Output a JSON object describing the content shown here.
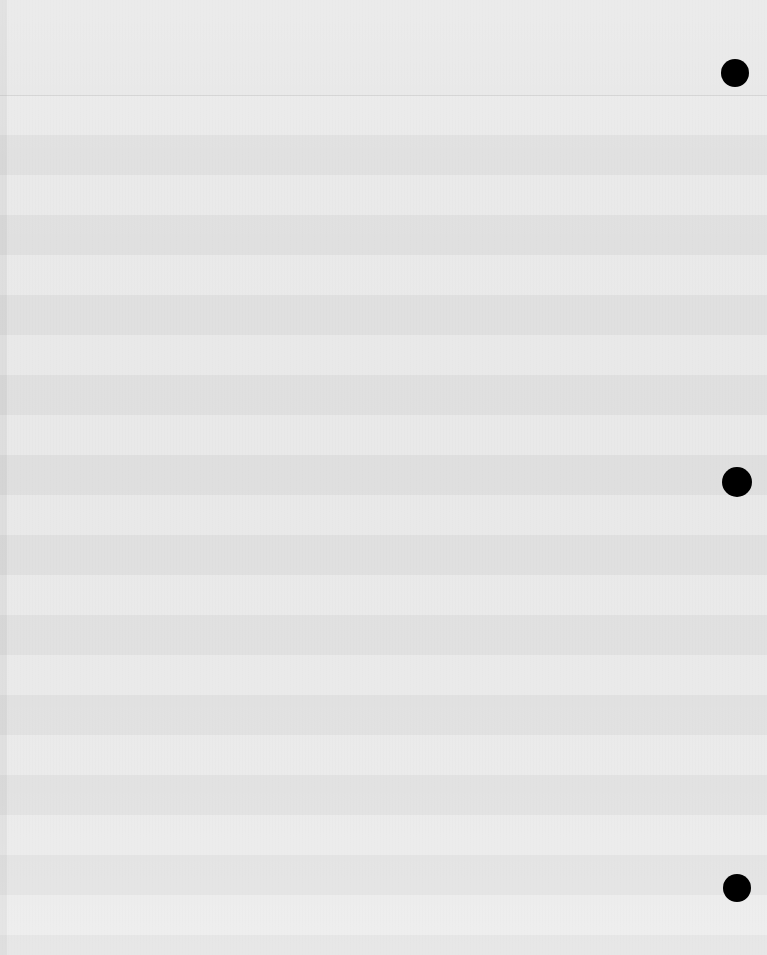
{
  "canvas": {
    "width": 767,
    "height": 955,
    "background_color": "#e2e2e2",
    "appearance": "overexposed",
    "description": "Heavily washed-out screenshot of a zebra-striped list/table view; cell text is bleached beyond legibility."
  },
  "header": {
    "title": "",
    "height": 95,
    "divider_y": 95
  },
  "gutter": {
    "width": 7,
    "color": "#bfbfbf"
  },
  "palette": {
    "row_odd": "#e6e6e6",
    "row_even": "#dbdbdb",
    "page_background": "#e2e2e2",
    "divider": "#8a8a8a",
    "status_dot": "#000000"
  },
  "list": {
    "row_height": 40,
    "first_row_top": 95,
    "row_count": 22,
    "columns": [
      "",
      "",
      "",
      ""
    ],
    "rows": [
      {
        "c1": "",
        "c2": "",
        "c3": "",
        "c4": ""
      },
      {
        "c1": "",
        "c2": "",
        "c3": "",
        "c4": ""
      },
      {
        "c1": "",
        "c2": "",
        "c3": "",
        "c4": ""
      },
      {
        "c1": "",
        "c2": "",
        "c3": "",
        "c4": ""
      },
      {
        "c1": "",
        "c2": "",
        "c3": "",
        "c4": ""
      },
      {
        "c1": "",
        "c2": "",
        "c3": "",
        "c4": ""
      },
      {
        "c1": "",
        "c2": "",
        "c3": "",
        "c4": ""
      },
      {
        "c1": "",
        "c2": "",
        "c3": "",
        "c4": ""
      },
      {
        "c1": "",
        "c2": "",
        "c3": "",
        "c4": ""
      },
      {
        "c1": "",
        "c2": "",
        "c3": "",
        "c4": ""
      },
      {
        "c1": "",
        "c2": "",
        "c3": "",
        "c4": ""
      },
      {
        "c1": "",
        "c2": "",
        "c3": "",
        "c4": ""
      },
      {
        "c1": "",
        "c2": "",
        "c3": "",
        "c4": ""
      },
      {
        "c1": "",
        "c2": "",
        "c3": "",
        "c4": ""
      },
      {
        "c1": "",
        "c2": "",
        "c3": "",
        "c4": ""
      },
      {
        "c1": "",
        "c2": "",
        "c3": "",
        "c4": ""
      },
      {
        "c1": "",
        "c2": "",
        "c3": "",
        "c4": ""
      },
      {
        "c1": "",
        "c2": "",
        "c3": "",
        "c4": ""
      },
      {
        "c1": "",
        "c2": "",
        "c3": "",
        "c4": ""
      },
      {
        "c1": "",
        "c2": "",
        "c3": "",
        "c4": ""
      },
      {
        "c1": "",
        "c2": "",
        "c3": "",
        "c4": ""
      },
      {
        "c1": "",
        "c2": "",
        "c3": "",
        "c4": ""
      }
    ]
  },
  "status_dots": [
    {
      "label": "",
      "cx": 735,
      "cy": 73,
      "diameter": 28,
      "color": "#000000"
    },
    {
      "label": "",
      "cx": 737,
      "cy": 482,
      "diameter": 30,
      "color": "#000000"
    },
    {
      "label": "",
      "cx": 737,
      "cy": 888,
      "diameter": 28,
      "color": "#000000"
    }
  ]
}
